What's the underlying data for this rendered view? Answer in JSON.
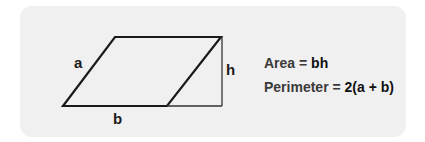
{
  "diagram": {
    "shape": {
      "vertices": {
        "top_left": [
          115,
          37
        ],
        "top_right": [
          221,
          37
        ],
        "bottom_right": [
          167,
          106
        ],
        "bottom_left": [
          63,
          106
        ]
      },
      "height_line": {
        "x": 222,
        "y1": 37,
        "y2": 106
      },
      "base_extension": {
        "x1": 167,
        "x2": 222,
        "y": 106
      },
      "stroke_color": "#1a1a1a",
      "background_color": "#f0f0f0"
    },
    "labels": {
      "side": "a",
      "base": "b",
      "height": "h"
    }
  },
  "formulas": {
    "area": {
      "key": "Area =",
      "value": "bh"
    },
    "perimeter": {
      "key": "Perimeter =",
      "value": "2(a + b)"
    }
  }
}
